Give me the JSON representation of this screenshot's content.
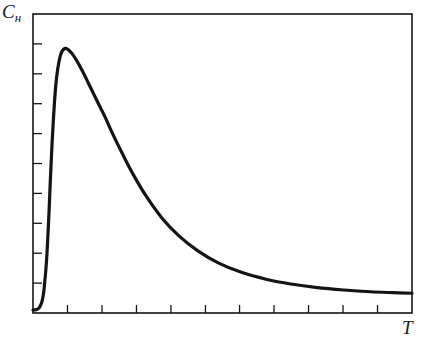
{
  "figure": {
    "background_color": "#ffffff",
    "ink_color": "#141414",
    "frame": {
      "left": 33,
      "top": 14,
      "right": 412,
      "bottom": 313,
      "stroke_width": 1.6,
      "closed": true
    }
  },
  "labels": {
    "y_axis": {
      "base": "C",
      "subscript": "н",
      "full": "Cн"
    },
    "x_axis": {
      "base": "T",
      "full": "T"
    }
  },
  "chart_data": {
    "type": "line",
    "title": "",
    "subtitle": "",
    "xlabel": "T",
    "ylabel": "Cн",
    "grid": false,
    "legend": false,
    "legend_position": "none",
    "tick_labels_shown": false,
    "x_ticks_count": 10,
    "y_ticks_count": 9,
    "x_tick_positions": [
      0.091,
      0.182,
      0.273,
      0.364,
      0.455,
      0.545,
      0.636,
      0.727,
      0.818,
      0.909
    ],
    "y_tick_positions": [
      0.1,
      0.2,
      0.3,
      0.4,
      0.5,
      0.6,
      0.7,
      0.8,
      0.9
    ],
    "xlim": [
      0,
      1
    ],
    "ylim": [
      0,
      1
    ],
    "series": [
      {
        "name": "Cн(T)",
        "color": "#141414",
        "line_width": 3.2,
        "x": [
          0.0,
          0.01,
          0.018,
          0.025,
          0.03,
          0.036,
          0.042,
          0.05,
          0.06,
          0.072,
          0.085,
          0.1,
          0.115,
          0.13,
          0.145,
          0.16,
          0.175,
          0.19,
          0.21,
          0.235,
          0.265,
          0.3,
          0.34,
          0.385,
          0.435,
          0.49,
          0.55,
          0.615,
          0.68,
          0.75,
          0.82,
          0.89,
          0.95,
          1.0
        ],
        "y": [
          0.01,
          0.012,
          0.02,
          0.045,
          0.09,
          0.18,
          0.33,
          0.56,
          0.76,
          0.86,
          0.885,
          0.872,
          0.845,
          0.81,
          0.772,
          0.733,
          0.694,
          0.656,
          0.6,
          0.535,
          0.462,
          0.388,
          0.318,
          0.258,
          0.208,
          0.167,
          0.136,
          0.113,
          0.097,
          0.085,
          0.077,
          0.071,
          0.068,
          0.066
        ]
      }
    ],
    "annotations": []
  }
}
